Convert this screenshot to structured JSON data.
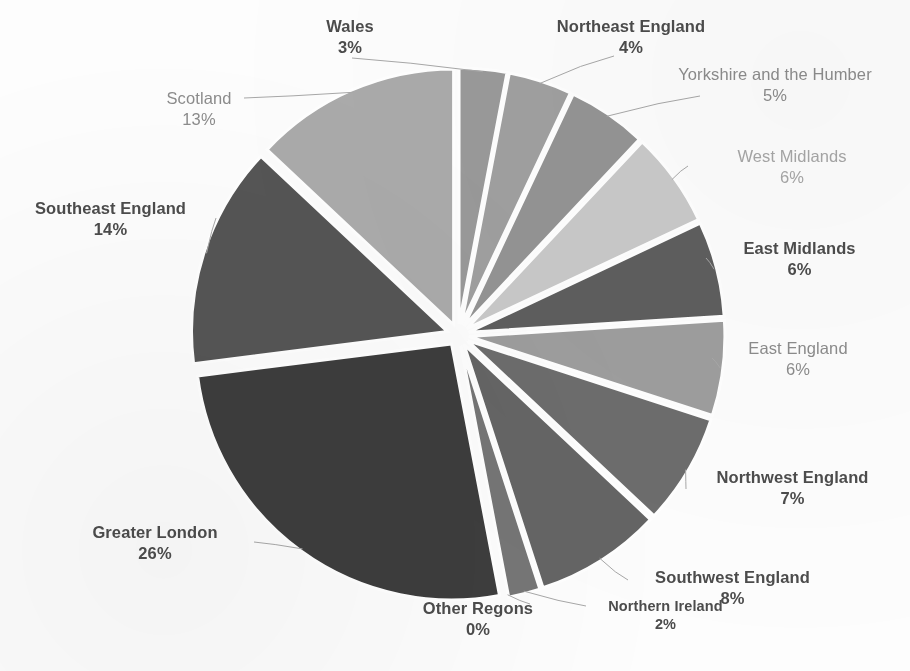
{
  "chart_data": {
    "type": "pie",
    "title": "",
    "subtitle": "",
    "xlabel": "",
    "ylabel": "",
    "legend_position": "none",
    "grid": false,
    "label_format": "name + percent",
    "exploded": true,
    "start_angle_deg": 0,
    "direction": "clockwise",
    "categories": [
      "Wales",
      "Northeast England",
      "Yorkshire and the Humber",
      "West Midlands",
      "East Midlands",
      "East England",
      "Northwest England",
      "Southwest England",
      "Northern Ireland",
      "Other Regons",
      "Greater London",
      "Southeast England",
      "Scotland"
    ],
    "values": [
      3,
      4,
      5,
      6,
      6,
      6,
      7,
      8,
      2,
      0,
      26,
      14,
      13
    ],
    "value_labels": [
      "3%",
      "4%",
      "5%",
      "6%",
      "6%",
      "6%",
      "7%",
      "8%",
      "2%",
      "0%",
      "26%",
      "14%",
      "13%"
    ],
    "unit": "%",
    "slice_colors": [
      "#9a9a9a",
      "#a0a0a0",
      "#949494",
      "#c9c9c9",
      "#5e5e5e",
      "#9e9e9e",
      "#6d6d6d",
      "#656565",
      "#767676",
      "#8a8a8a",
      "#3d3d3d",
      "#555555",
      "#ababab"
    ],
    "slices": [
      {
        "label": "Wales",
        "value": 3,
        "display": "3%",
        "color": "#9a9a9a"
      },
      {
        "label": "Northeast England",
        "value": 4,
        "display": "4%",
        "color": "#a0a0a0"
      },
      {
        "label": "Yorkshire and the Humber",
        "value": 5,
        "display": "5%",
        "color": "#949494"
      },
      {
        "label": "West Midlands",
        "value": 6,
        "display": "6%",
        "color": "#c9c9c9"
      },
      {
        "label": "East Midlands",
        "value": 6,
        "display": "6%",
        "color": "#5e5e5e"
      },
      {
        "label": "East England",
        "value": 6,
        "display": "6%",
        "color": "#9e9e9e"
      },
      {
        "label": "Northwest England",
        "value": 7,
        "display": "7%",
        "color": "#6d6d6d"
      },
      {
        "label": "Southwest England",
        "value": 8,
        "display": "8%",
        "color": "#656565"
      },
      {
        "label": "Northern Ireland",
        "value": 2,
        "display": "2%",
        "color": "#767676"
      },
      {
        "label": "Other Regons",
        "value": 0,
        "display": "0%",
        "color": "#8a8a8a"
      },
      {
        "label": "Greater London",
        "value": 26,
        "display": "26%",
        "color": "#3d3d3d"
      },
      {
        "label": "Southeast England",
        "value": 14,
        "display": "14%",
        "color": "#555555"
      },
      {
        "label": "Scotland",
        "value": 13,
        "display": "13%",
        "color": "#ababab"
      }
    ]
  },
  "labels": {
    "wales": {
      "name": "Wales",
      "pct": "3%"
    },
    "northeast": {
      "name": "Northeast England",
      "pct": "4%"
    },
    "yorkshire": {
      "name": "Yorkshire and the Humber",
      "pct": "5%"
    },
    "westmid": {
      "name": "West Midlands",
      "pct": "6%"
    },
    "eastmid": {
      "name": "East Midlands",
      "pct": "6%"
    },
    "eastengland": {
      "name": "East England",
      "pct": "6%"
    },
    "northwest": {
      "name": "Northwest England",
      "pct": "7%"
    },
    "southwest": {
      "name": "Southwest England",
      "pct": "8%"
    },
    "nireland": {
      "name": "Northern Ireland",
      "pct": "2%"
    },
    "other": {
      "name": "Other Regons",
      "pct": "0%"
    },
    "london": {
      "name": "Greater London",
      "pct": "26%"
    },
    "southeast": {
      "name": "Southeast England",
      "pct": "14%"
    },
    "scotland": {
      "name": "Scotland",
      "pct": "13%"
    }
  },
  "style": {
    "background": "#fdfdfd",
    "leader_line_color": "#a8a8a8",
    "slice_gap_color": "#ffffff"
  }
}
